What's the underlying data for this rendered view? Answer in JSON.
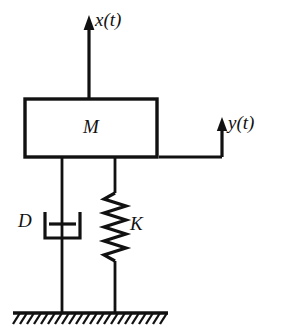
{
  "figure": {
    "background_color": "#ffffff",
    "line_color": "#111111"
  },
  "labels": {
    "displacement_output": "x(t)",
    "displacement_input": "y(t)",
    "mass": "M",
    "damper": "D",
    "spring": "K"
  },
  "components": {
    "mass_block": {
      "name": "M",
      "x": 25,
      "y": 99,
      "width": 132,
      "height": 58
    },
    "damper": {
      "name": "D",
      "rod_x": 62,
      "cup_left": 45,
      "cup_right": 80,
      "cup_top": 212,
      "cup_bottom": 238,
      "piston_y": 224
    },
    "spring": {
      "name": "K",
      "rod_x": 115,
      "top": 192,
      "bottom": 260,
      "amplitude": 11,
      "coils": 9
    },
    "ground": {
      "line_y": 313,
      "left": 13,
      "right": 168,
      "hatch_count": 23,
      "hatch_length": 11
    },
    "arrow_x": {
      "stem_x": 89,
      "from_y": 99,
      "to_y": 20
    },
    "arrow_y": {
      "horizontal_y": 157,
      "from_x": 160,
      "to_x": 222,
      "stem_x": 222,
      "to_y": 122
    }
  }
}
